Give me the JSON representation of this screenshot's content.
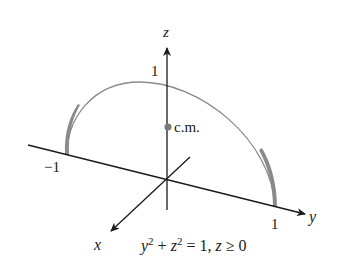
{
  "figure": {
    "axes": {
      "z_label": "z",
      "y_label": "y",
      "x_label": "x",
      "z_tick": "1",
      "y_tick_neg": "−1",
      "y_tick_pos": "1"
    },
    "center_of_mass_label": "c.m.",
    "equation": {
      "y": "y",
      "y_exp": "2",
      "plus": " + ",
      "z": "z",
      "z_exp": "2",
      "rest": " = 1, ",
      "z2": "z",
      "cond": " ≥ 0"
    },
    "colors": {
      "axis": "#1a1a1a",
      "arc": "#8a8a8a",
      "cm_dot": "#7a7a7a",
      "background": "#ffffff"
    }
  }
}
